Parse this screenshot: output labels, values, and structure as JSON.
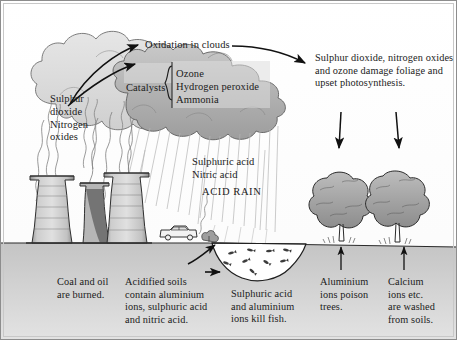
{
  "diagram": {
    "palette": {
      "ink": "#1b1b1b",
      "cloud_light": "#d9d9d9",
      "cloud_mid": "#bdbdbd",
      "cloud_dark": "#9a9a9a",
      "ground": "#c9c9c9",
      "sky": "#ffffff",
      "tower": "#cfcfcf",
      "tree": "#a8a8a8",
      "water": "#ffffff",
      "border": "#6b6b6b"
    },
    "labels": {
      "oxidation": "Oxidation in clouds",
      "catalysts": "Catalysts",
      "catalyst_list": "Ozone\nHydrogen peroxide\nAmmonia",
      "source_emissions": "Sulphur\ndioxide\nNitrogen\noxides",
      "foliage_damage": "Sulphur dioxide, nitrogen oxides and ozone damage foliage and upset photosynthesis.",
      "acids": "Sulphuric acid\nNitric acid",
      "acid_rain": "ACID RAIN",
      "coal_burned": "Coal and oil\nare burned.",
      "acidified_soils": "Acidified soils\ncontain aluminium\nions, sulphuric acid\nand nitric acid.",
      "fish_killed": "Sulphuric acid\nand aluminium\nions kill fish.",
      "aluminium_trees": "Aluminium\nions poison\ntrees.",
      "calcium_washed": "Calcium\nions etc.\nare washed\nfrom soils."
    },
    "scene_elements": {
      "cooling_towers": 3,
      "trees": 2,
      "car": 1,
      "lake": 1,
      "fish_in_lake": 9,
      "rain_streaks": true
    }
  }
}
